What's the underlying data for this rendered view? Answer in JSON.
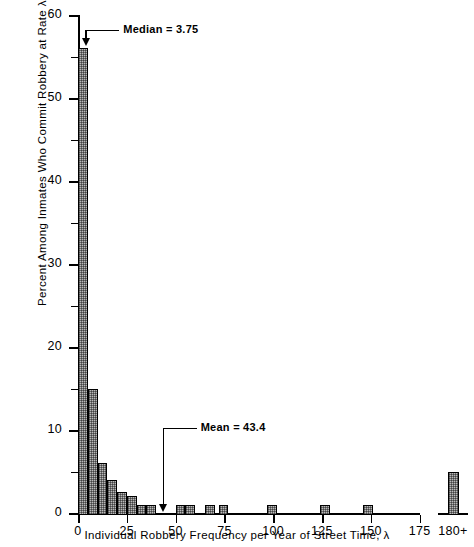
{
  "chart_data": {
    "type": "bar",
    "title": "",
    "xlabel": "Individual Robbery Frequency per Year of Street Time, λ",
    "ylabel": "Percent Among Inmates Who Commit Robbery at Rate λ",
    "xlim": [
      -2.5,
      177.5
    ],
    "ylim": [
      0,
      60
    ],
    "grid": false,
    "legend": null,
    "bin_width": 5,
    "x_ticks": [
      0,
      25,
      50,
      75,
      100,
      125,
      150,
      175
    ],
    "x_tick_labels": [
      "0",
      "25",
      "50",
      "75",
      "100",
      "125",
      "150",
      "175"
    ],
    "x_overflow_tick_label": "180+",
    "y_ticks": [
      0,
      10,
      20,
      30,
      40,
      50,
      60
    ],
    "y_tick_labels": [
      "0",
      "10",
      "20",
      "30",
      "40",
      "50",
      "60"
    ],
    "y_minor_ticks": [
      5,
      15,
      25,
      35,
      45,
      55
    ],
    "bar_facecolor": "#b9b9b9",
    "bar_edgecolor": "#000000",
    "bars": [
      {
        "bin_center": 2.5,
        "bin_start": 0,
        "value": 56.0
      },
      {
        "bin_center": 7.5,
        "bin_start": 5,
        "value": 15.0
      },
      {
        "bin_center": 12.5,
        "bin_start": 10,
        "value": 6.0
      },
      {
        "bin_center": 17.5,
        "bin_start": 15,
        "value": 4.0
      },
      {
        "bin_center": 22.5,
        "bin_start": 20,
        "value": 2.5
      },
      {
        "bin_center": 27.5,
        "bin_start": 25,
        "value": 2.0
      },
      {
        "bin_center": 32.5,
        "bin_start": 30,
        "value": 1.0
      },
      {
        "bin_center": 37.5,
        "bin_start": 35,
        "value": 1.0
      },
      {
        "bin_center": 52.5,
        "bin_start": 50,
        "value": 1.0
      },
      {
        "bin_center": 57.5,
        "bin_start": 55,
        "value": 1.0
      },
      {
        "bin_center": 67.5,
        "bin_start": 65,
        "value": 1.0
      },
      {
        "bin_center": 75.0,
        "bin_start": 72,
        "value": 1.0
      },
      {
        "bin_center": 100.0,
        "bin_start": 97,
        "value": 1.0
      },
      {
        "bin_center": 127.0,
        "bin_start": 124,
        "value": 1.0
      },
      {
        "bin_center": 149.0,
        "bin_start": 146,
        "value": 1.0
      }
    ],
    "overflow_bar": {
      "label": "180+",
      "value": 5.0
    },
    "annotations": [
      {
        "name": "median",
        "text": "Median = 3.75",
        "x_value": 3.75,
        "y_value": 56.0
      },
      {
        "name": "mean",
        "text": "Mean = 43.4",
        "x_value": 43.4,
        "y_value": 0.0
      }
    ]
  }
}
